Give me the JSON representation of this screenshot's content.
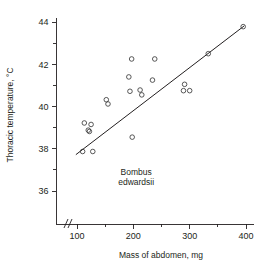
{
  "chart_data": {
    "type": "scatter",
    "title": "",
    "xlabel": "Mass of abdomen, mg",
    "ylabel": "Thoracic temperature, °C",
    "xlim": [
      75,
      410
    ],
    "ylim": [
      35,
      44
    ],
    "grid": false,
    "legend": "none",
    "axis_break_x": true,
    "xticks_major": [
      100,
      200,
      300,
      400
    ],
    "xticks_minor": [
      150,
      250,
      350
    ],
    "yticks_major": [
      36,
      38,
      40,
      42,
      44
    ],
    "yticks_minor": [
      37,
      39,
      41,
      43
    ],
    "xtick_labels": [
      "100",
      "200",
      "300",
      "400"
    ],
    "ytick_labels": [
      "36",
      "38",
      "40",
      "42",
      "44"
    ],
    "annotations": [
      {
        "name": "species-label-line1",
        "text": "Bombus",
        "x": 205,
        "y": 36.75
      },
      {
        "name": "species-label-line2",
        "text": "edwardsii",
        "x": 205,
        "y": 36.3
      }
    ],
    "points": [
      {
        "x": 110,
        "y": 37.87
      },
      {
        "x": 113,
        "y": 39.22
      },
      {
        "x": 120,
        "y": 38.88
      },
      {
        "x": 122,
        "y": 38.82
      },
      {
        "x": 125,
        "y": 39.15
      },
      {
        "x": 128,
        "y": 37.87
      },
      {
        "x": 152,
        "y": 40.32
      },
      {
        "x": 155,
        "y": 40.12
      },
      {
        "x": 192,
        "y": 41.4
      },
      {
        "x": 194,
        "y": 40.72
      },
      {
        "x": 197,
        "y": 42.25
      },
      {
        "x": 198,
        "y": 38.55
      },
      {
        "x": 212,
        "y": 40.78
      },
      {
        "x": 215,
        "y": 40.55
      },
      {
        "x": 234,
        "y": 41.25
      },
      {
        "x": 238,
        "y": 42.25
      },
      {
        "x": 289,
        "y": 40.75
      },
      {
        "x": 291,
        "y": 41.05
      },
      {
        "x": 300,
        "y": 40.75
      },
      {
        "x": 333,
        "y": 42.5
      },
      {
        "x": 395,
        "y": 43.78
      }
    ],
    "fit_line": {
      "name": "regression-line",
      "x1": 98,
      "y1": 37.72,
      "x2": 397,
      "y2": 43.82
    }
  }
}
